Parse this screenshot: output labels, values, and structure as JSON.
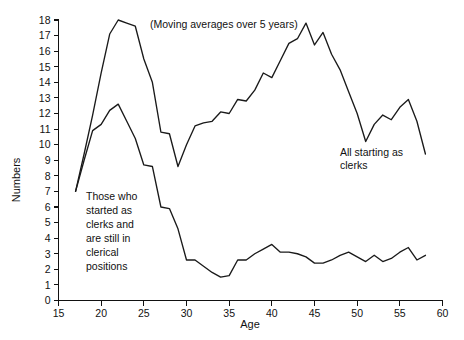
{
  "chart_data": {
    "type": "line",
    "title": "",
    "annotation_note": "(Moving averages over 5 years)",
    "xlabel": "Age",
    "ylabel": "Numbers",
    "xlim": [
      15,
      60
    ],
    "ylim": [
      0,
      18
    ],
    "xticks": [
      15,
      20,
      25,
      30,
      35,
      40,
      45,
      50,
      55,
      60
    ],
    "yticks": [
      0,
      1,
      2,
      3,
      4,
      5,
      6,
      7,
      8,
      9,
      10,
      11,
      12,
      13,
      14,
      15,
      16,
      17,
      18
    ],
    "grid": false,
    "legend_position": "inline-annotations",
    "line_color": "#1a1a1a",
    "background_color": "#ffffff",
    "series": [
      {
        "name": "All starting as clerks",
        "label_text_line1": "All starting as",
        "label_text_line2": "clerks",
        "x": [
          17,
          18,
          19,
          20,
          21,
          22,
          23,
          24,
          25,
          26,
          27,
          28,
          29,
          30,
          31,
          32,
          33,
          34,
          35,
          36,
          37,
          38,
          39,
          40,
          41,
          42,
          43,
          44,
          45,
          46,
          47,
          48,
          49,
          50,
          51,
          52,
          53,
          54,
          55,
          56,
          57,
          58
        ],
        "values": [
          7.0,
          9.4,
          11.9,
          14.6,
          17.1,
          18.0,
          17.8,
          17.6,
          15.5,
          14.0,
          10.8,
          10.7,
          8.6,
          10.0,
          11.2,
          11.4,
          11.5,
          12.1,
          12.0,
          12.9,
          12.8,
          13.5,
          14.6,
          14.3,
          15.4,
          16.5,
          16.8,
          17.8,
          16.4,
          17.2,
          15.8,
          14.8,
          13.4,
          12.0,
          10.2,
          11.3,
          11.9,
          11.6,
          12.4,
          12.9,
          11.5,
          9.4
        ]
      },
      {
        "name": "Those who started as clerks and are still in clerical positions",
        "label_text_line1": "Those who",
        "label_text_line2": "started as",
        "label_text_line3": "clerks and",
        "label_text_line4": "are still in",
        "label_text_line5": "clerical",
        "label_text_line6": "positions",
        "x": [
          17,
          18,
          19,
          20,
          21,
          22,
          23,
          24,
          25,
          26,
          27,
          28,
          29,
          30,
          31,
          32,
          33,
          34,
          35,
          36,
          37,
          38,
          39,
          40,
          41,
          42,
          43,
          44,
          45,
          46,
          47,
          48,
          49,
          50,
          51,
          52,
          53,
          54,
          55,
          56,
          57,
          58
        ],
        "values": [
          7.0,
          9.0,
          10.9,
          11.3,
          12.2,
          12.6,
          11.5,
          10.4,
          8.7,
          8.6,
          6.0,
          5.9,
          4.6,
          2.6,
          2.6,
          2.2,
          1.8,
          1.5,
          1.6,
          2.6,
          2.6,
          3.0,
          3.3,
          3.6,
          3.1,
          3.1,
          3.0,
          2.8,
          2.4,
          2.4,
          2.6,
          2.9,
          3.1,
          2.8,
          2.5,
          2.9,
          2.5,
          2.7,
          3.1,
          3.4,
          2.6,
          2.9
        ]
      }
    ]
  },
  "axis": {
    "x_title": "Age",
    "y_title": "Numbers",
    "x_tick_labels": [
      "15",
      "20",
      "25",
      "30",
      "35",
      "40",
      "45",
      "50",
      "55",
      "60"
    ],
    "y_tick_labels": [
      "0",
      "1",
      "2",
      "3",
      "4",
      "5",
      "6",
      "7",
      "8",
      "9",
      "10",
      "11",
      "12",
      "13",
      "14",
      "15",
      "16",
      "17",
      "18"
    ]
  },
  "annotations": {
    "moving_average_note": "(Moving averages over 5 years)",
    "upper_series_label": "All starting as\nclerks",
    "lower_series_label": "Those who\nstarted as\nclerks and\nare still in\nclerical\npositions"
  }
}
